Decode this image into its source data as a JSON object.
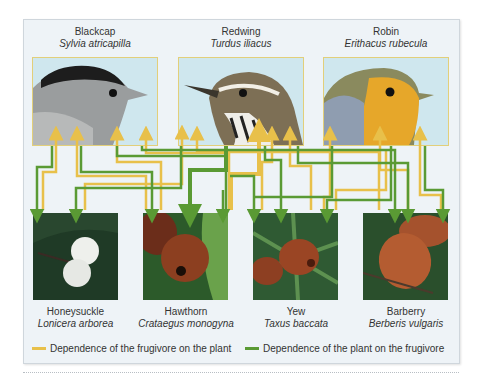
{
  "birds": [
    {
      "common": "Blackcap",
      "scientific": "Sylvia atricapilla"
    },
    {
      "common": "Redwing",
      "scientific": "Turdus iliacus"
    },
    {
      "common": "Robin",
      "scientific": "Erithacus rubecula"
    }
  ],
  "plants": [
    {
      "common": "Honeysuckle",
      "scientific": "Lonicera arborea"
    },
    {
      "common": "Hawthorn",
      "scientific": "Crataegus monogyna"
    },
    {
      "common": "Yew",
      "scientific": "Taxus baccata"
    },
    {
      "common": "Barberry",
      "scientific": "Berberis vulgaris"
    }
  ],
  "legend": {
    "frugivore_on_plant": "Dependence of the frugivore on the plant",
    "plant_on_frugivore": "Dependence of the plant on the frugivore"
  },
  "colors": {
    "frugivore_dependence": "#e8c04a",
    "plant_dependence": "#5a9a34"
  }
}
